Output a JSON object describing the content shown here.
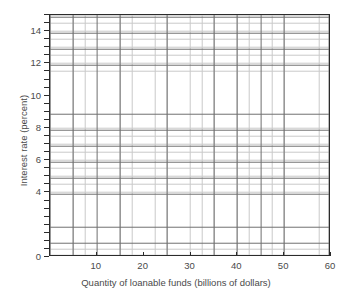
{
  "chart_data": {
    "type": "line",
    "title": "",
    "subtitle": "",
    "xlabel": "Quantity of loanable funds (billions of dollars)",
    "ylabel": "Interest rate (percent)",
    "xlim": [
      0,
      60
    ],
    "ylim": [
      0,
      15
    ],
    "x_tick_labels": [
      "10",
      "20",
      "30",
      "40",
      "50",
      "60"
    ],
    "x_tick_values": [
      10,
      20,
      30,
      40,
      50,
      60
    ],
    "x_major_step": 5,
    "x_minor_step": 2.5,
    "y_tick_labels": [
      "0",
      "4",
      "6",
      "8",
      "10",
      "12",
      "14"
    ],
    "y_tick_values": [
      0,
      4,
      6,
      8,
      10,
      12,
      14
    ],
    "y_major_step": 1,
    "y_minor_step": 0.5,
    "grid": true,
    "grid_major_color": "#6f6f6f",
    "grid_minor_color": "#c9c9c9",
    "axis_color": "#2b2b2b",
    "text_color": "#4a4a4a",
    "background": "#ffffff",
    "legend": null,
    "legend_position": "none",
    "series": [],
    "annotations": [],
    "note": "Empty plotting grid; no data series are drawn."
  },
  "axes": {
    "x_ticks": [
      {
        "label": "10",
        "value": 10
      },
      {
        "label": "20",
        "value": 20
      },
      {
        "label": "30",
        "value": 30
      },
      {
        "label": "40",
        "value": 40
      },
      {
        "label": "50",
        "value": 50
      },
      {
        "label": "60",
        "value": 60
      }
    ],
    "y_ticks": [
      {
        "label": "0",
        "value": 0
      },
      {
        "label": "4",
        "value": 4
      },
      {
        "label": "6",
        "value": 6
      },
      {
        "label": "8",
        "value": 8
      },
      {
        "label": "10",
        "value": 10
      },
      {
        "label": "12",
        "value": 12
      },
      {
        "label": "14",
        "value": 14
      }
    ]
  }
}
